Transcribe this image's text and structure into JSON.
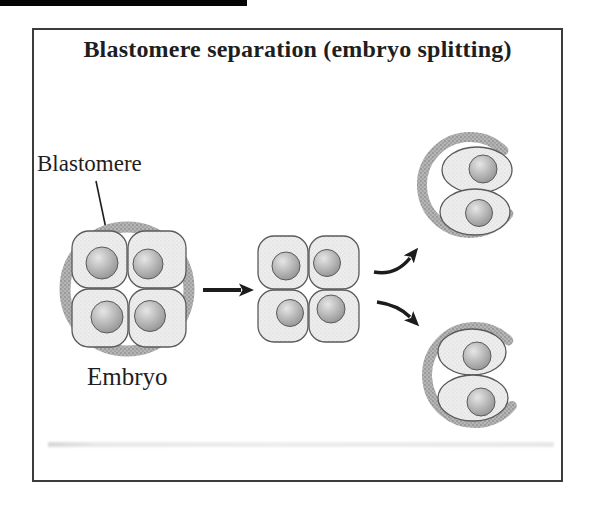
{
  "figure": {
    "title": "Blastomere separation (embryo splitting)",
    "labels": {
      "blastomere": "Blastomere",
      "embryo": "Embryo"
    }
  },
  "colors": {
    "ink": "#1e1e1e",
    "frame_border": "#3c3c3c",
    "zona": "#b5b5b5",
    "zona_dot": "#8e8e8e",
    "cell_fill": "#ededed",
    "cell_dot": "#dcdcdc",
    "cell_stroke": "#5a5a5a",
    "nucleus_light": "#e6e6e6",
    "nucleus_mid": "#b3b3b3",
    "nucleus_dark": "#8a8a8a",
    "arrow": "#1c1c1c"
  }
}
